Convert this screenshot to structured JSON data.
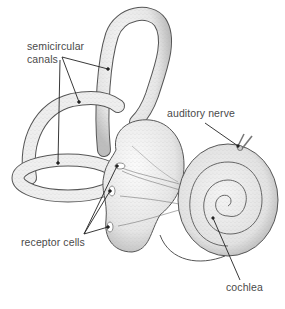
{
  "diagram": {
    "labels": {
      "semicircular_line1": "semicircular",
      "semicircular_line2": "canals",
      "auditory_nerve": "auditory nerve",
      "receptor_cells": "receptor cells",
      "cochlea": "cochlea"
    },
    "colors": {
      "outline": "#555555",
      "fill": "#f2f2f2",
      "shade": "#cfcfcf",
      "leader": "#222222",
      "text": "#4a4a4a"
    },
    "callouts": [
      {
        "label": "semicircular canals",
        "targets": 3
      },
      {
        "label": "auditory nerve",
        "targets": 1
      },
      {
        "label": "receptor cells",
        "targets": 3
      },
      {
        "label": "cochlea",
        "targets": 1
      }
    ]
  }
}
